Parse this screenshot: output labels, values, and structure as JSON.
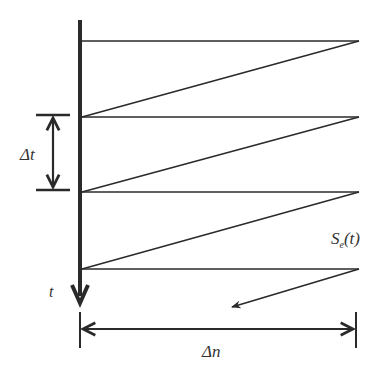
{
  "diagram": {
    "type": "sawtooth-scan",
    "colors": {
      "line": "#2a2a2a",
      "background": "#ffffff"
    },
    "axis": {
      "label": "t",
      "direction": "down"
    },
    "delta_t": {
      "label": "Δt"
    },
    "delta_n": {
      "label": "Δn"
    },
    "signal": {
      "label_main": "S",
      "label_sub": "e",
      "label_arg": "(t)"
    },
    "sawtooth": {
      "horizontal_lines_y": [
        41,
        117,
        192,
        269
      ],
      "x_left": 80,
      "x_right": 359
    }
  }
}
